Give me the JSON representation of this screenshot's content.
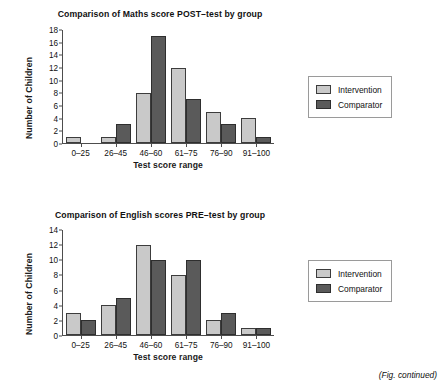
{
  "page": {
    "caption": "(Fig. continued)"
  },
  "legend": {
    "items": [
      {
        "label": "Intervention",
        "swatch": "legend-swatch-intervention",
        "color": "#c9c9c9"
      },
      {
        "label": "Comparator",
        "swatch": "legend-swatch-comparator",
        "color": "#5a5a5a"
      }
    ]
  },
  "chart_data": [
    {
      "type": "bar",
      "title": "Comparison of Maths score POST–test by group",
      "xlabel": "Test score range",
      "ylabel": "Number of Children",
      "categories": [
        "0–25",
        "26–45",
        "46–60",
        "61–75",
        "76–90",
        "91–100"
      ],
      "series": [
        {
          "name": "Intervention",
          "color": "#c9c9c9",
          "values": [
            1,
            1,
            8,
            12,
            5,
            4
          ]
        },
        {
          "name": "Comparator",
          "color": "#5a5a5a",
          "values": [
            0,
            3,
            17,
            7,
            3,
            1
          ]
        }
      ],
      "ylim": [
        0,
        18
      ],
      "yticks": [
        0,
        2,
        4,
        6,
        8,
        10,
        12,
        14,
        16,
        18
      ],
      "grid": false,
      "legend_position": "right"
    },
    {
      "type": "bar",
      "title": "Comparison of English scores PRE–test by group",
      "xlabel": "Test score range",
      "ylabel": "Number of Children",
      "categories": [
        "0–25",
        "26–45",
        "46–60",
        "61–75",
        "76–90",
        "91–100"
      ],
      "series": [
        {
          "name": "Intervention",
          "color": "#c9c9c9",
          "values": [
            3,
            4,
            12,
            8,
            2,
            1
          ]
        },
        {
          "name": "Comparator",
          "color": "#5a5a5a",
          "values": [
            2,
            5,
            10,
            10,
            3,
            1
          ]
        }
      ],
      "ylim": [
        0,
        14
      ],
      "yticks": [
        0,
        2,
        4,
        6,
        8,
        10,
        12,
        14
      ],
      "grid": false,
      "legend_position": "right"
    }
  ]
}
